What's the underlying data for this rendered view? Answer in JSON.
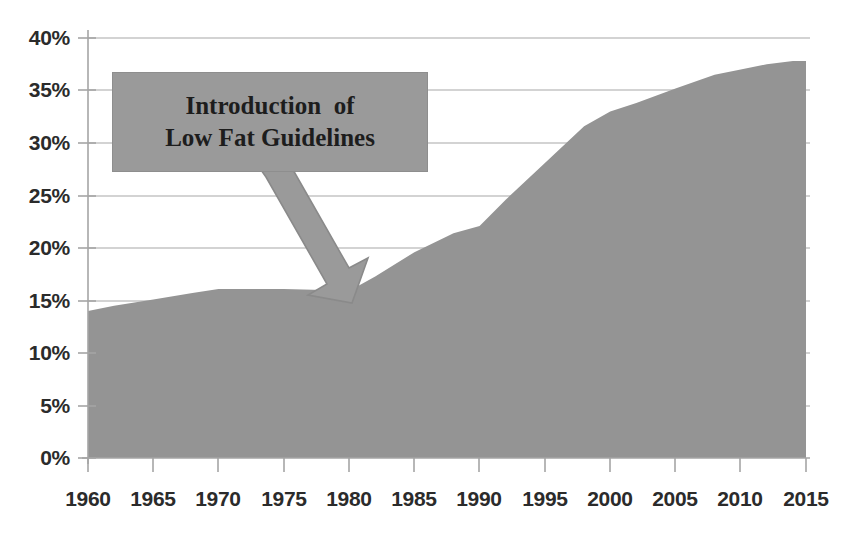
{
  "chart_data": {
    "type": "area",
    "title": "",
    "subtitle": "",
    "xlabel": "",
    "ylabel": "",
    "xlim": [
      1960,
      2015
    ],
    "ylim": [
      0,
      40
    ],
    "grid": true,
    "legend_position": "none",
    "series_color": "#949494",
    "gridline_color": "#bfbfbf",
    "axis_color": "#9a9a9a",
    "x_tick_labels": [
      "1960",
      "1965",
      "1970",
      "1975",
      "1980",
      "1985",
      "1990",
      "1995",
      "2000",
      "2005",
      "2010",
      "2015"
    ],
    "x_ticks": [
      1960,
      1965,
      1970,
      1975,
      1980,
      1985,
      1990,
      1995,
      2000,
      2005,
      2010,
      2015
    ],
    "y_tick_labels": [
      "0%",
      "5%",
      "10%",
      "15%",
      "20%",
      "25%",
      "30%",
      "35%",
      "40%"
    ],
    "y_ticks": [
      0,
      5,
      10,
      15,
      20,
      25,
      30,
      35,
      40
    ],
    "series": [
      {
        "name": "",
        "x": [
          1960,
          1962,
          1965,
          1968,
          1970,
          1972,
          1975,
          1978,
          1980,
          1982,
          1985,
          1988,
          1990,
          1992,
          1995,
          1998,
          2000,
          2002,
          2005,
          2008,
          2010,
          2012,
          2014,
          2015
        ],
        "values": [
          14.0,
          14.5,
          15.1,
          15.7,
          16.1,
          16.1,
          16.1,
          16.0,
          15.9,
          17.3,
          19.6,
          21.4,
          22.1,
          24.6,
          28.1,
          31.6,
          33.0,
          33.8,
          35.2,
          36.5,
          37.0,
          37.5,
          37.8,
          37.8
        ]
      }
    ],
    "annotations": [
      {
        "name": "low-fat-guidelines-callout",
        "line1": "Introduction  of",
        "line2": "Low Fat Guidelines",
        "box_fill": "#9a9a9a",
        "arrow_fill": "#9a9a9a",
        "points_to_year": 1981,
        "points_to_value": 16.5
      }
    ]
  }
}
